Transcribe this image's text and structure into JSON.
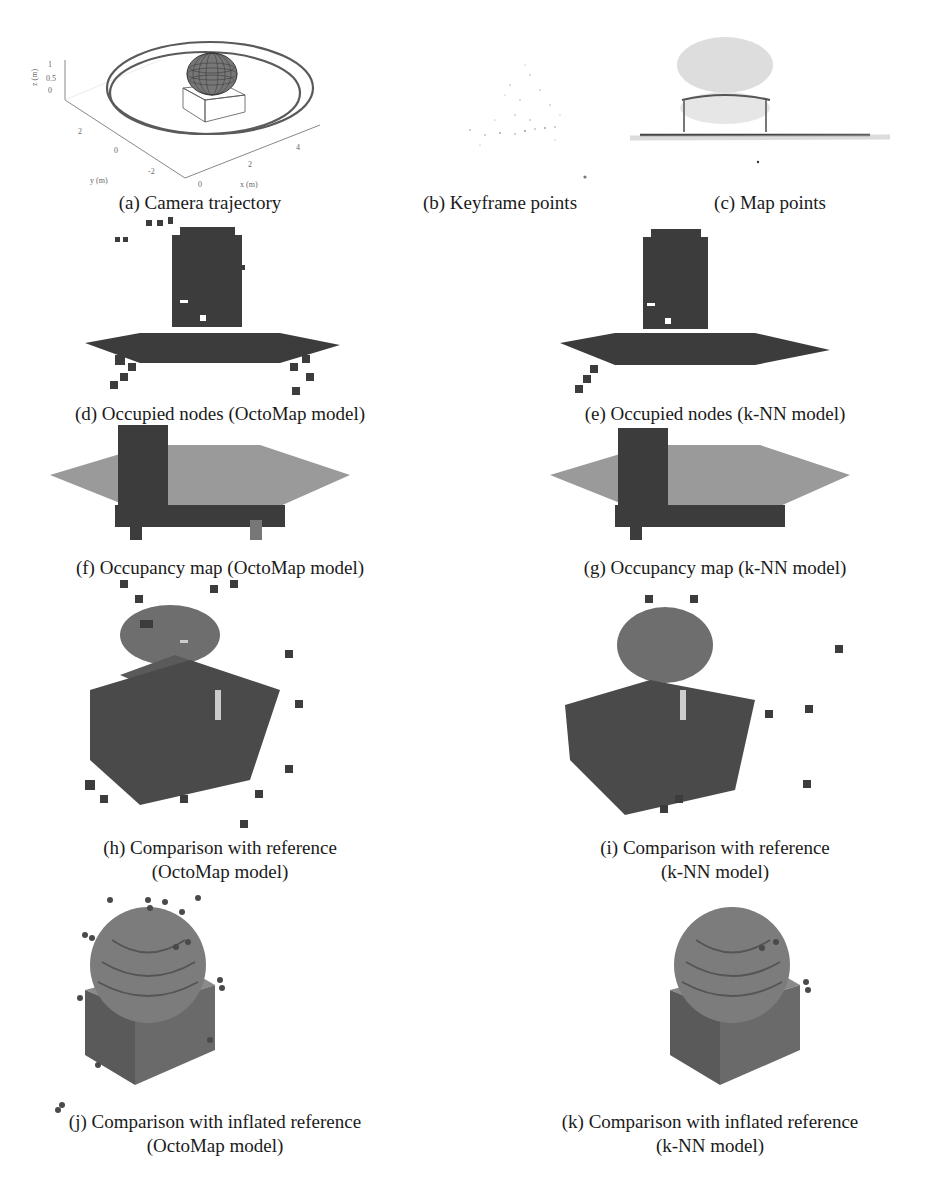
{
  "figure": {
    "panels": [
      {
        "id": "a",
        "caption": [
          "(a) Camera trajectory"
        ]
      },
      {
        "id": "b",
        "caption": [
          "(b) Keyframe points"
        ]
      },
      {
        "id": "c",
        "caption": [
          "(c) Map points"
        ]
      },
      {
        "id": "d",
        "caption": [
          "(d) Occupied nodes (OctoMap model)"
        ]
      },
      {
        "id": "e",
        "caption": [
          "(e) Occupied nodes (k-NN model)"
        ]
      },
      {
        "id": "f",
        "caption": [
          "(f) Occupancy map (OctoMap model)"
        ]
      },
      {
        "id": "g",
        "caption": [
          "(g) Occupancy map (k-NN model)"
        ]
      },
      {
        "id": "h",
        "caption": [
          "(h) Comparison with reference",
          "(OctoMap model)"
        ]
      },
      {
        "id": "i",
        "caption": [
          "(i) Comparison with reference",
          "(k-NN model)"
        ]
      },
      {
        "id": "j",
        "caption": [
          "(j) Comparison with inflated reference",
          "(OctoMap model)"
        ]
      },
      {
        "id": "k",
        "caption": [
          "(k) Comparison with inflated reference",
          "(k-NN model)"
        ]
      }
    ],
    "plot_a": {
      "z_label": "z (m)",
      "z_ticks": [
        "1",
        "0.5",
        "0"
      ],
      "y_label": "y (m)",
      "y_ticks": [
        "2",
        "0",
        "-2"
      ],
      "x_label": "x (m)",
      "x_ticks": [
        "0",
        "2",
        "4"
      ]
    },
    "colors": {
      "voxel_dark": "#3c3c3c",
      "voxel_light": "#9a9a9a",
      "reference": "#6e6e6e",
      "trajectory": "#555555"
    }
  }
}
